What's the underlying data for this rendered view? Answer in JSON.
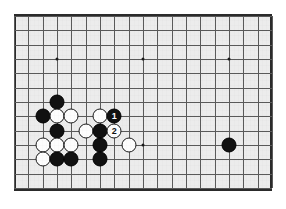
{
  "figure": {
    "kind": "go-board-diagram",
    "caption": "",
    "board_background_color": "#ececec",
    "line_color": "#5a5a5a",
    "border_color": "#2b2b2b",
    "black_stone_color": "#111111",
    "white_stone_color": "#fdfdfd"
  },
  "geometry": {
    "origin_x": 14,
    "origin_y": 16,
    "cell": 14.33,
    "cols": 18,
    "rows": 12,
    "stone_diameter": 15
  },
  "star_points": [
    {
      "col": 3,
      "row": 3
    },
    {
      "col": 9,
      "row": 3
    },
    {
      "col": 15,
      "row": 3
    },
    {
      "col": 9,
      "row": 9
    }
  ],
  "stones": [
    {
      "color": "black",
      "col": 3,
      "row": 6,
      "label": ""
    },
    {
      "color": "black",
      "col": 2,
      "row": 7,
      "label": ""
    },
    {
      "color": "white",
      "col": 3,
      "row": 7,
      "label": ""
    },
    {
      "color": "white",
      "col": 4,
      "row": 7,
      "label": ""
    },
    {
      "color": "white",
      "col": 6,
      "row": 7,
      "label": ""
    },
    {
      "color": "black",
      "col": 7,
      "row": 7,
      "label": "1"
    },
    {
      "color": "black",
      "col": 3,
      "row": 8,
      "label": ""
    },
    {
      "color": "white",
      "col": 5,
      "row": 8,
      "label": ""
    },
    {
      "color": "black",
      "col": 6,
      "row": 8,
      "label": ""
    },
    {
      "color": "white",
      "col": 7,
      "row": 8,
      "label": "2"
    },
    {
      "color": "white",
      "col": 2,
      "row": 9,
      "label": ""
    },
    {
      "color": "white",
      "col": 3,
      "row": 9,
      "label": ""
    },
    {
      "color": "white",
      "col": 4,
      "row": 9,
      "label": ""
    },
    {
      "color": "black",
      "col": 6,
      "row": 9,
      "label": ""
    },
    {
      "color": "white",
      "col": 8,
      "row": 9,
      "label": ""
    },
    {
      "color": "white",
      "col": 2,
      "row": 10,
      "label": ""
    },
    {
      "color": "black",
      "col": 3,
      "row": 10,
      "label": ""
    },
    {
      "color": "black",
      "col": 4,
      "row": 10,
      "label": ""
    },
    {
      "color": "black",
      "col": 6,
      "row": 10,
      "label": ""
    },
    {
      "color": "black",
      "col": 15,
      "row": 9,
      "label": ""
    }
  ],
  "move_numbers": {
    "move_1": "1",
    "move_2": "2"
  }
}
